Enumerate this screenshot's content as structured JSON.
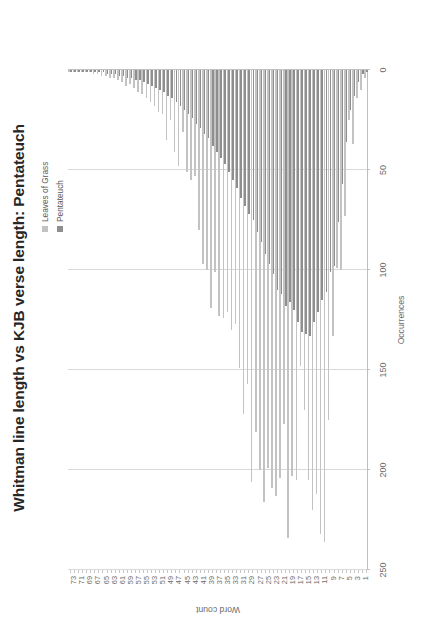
{
  "chart_data": {
    "type": "bar",
    "orientation": "horizontal",
    "title": "Whitman line length vs KJB verse length: Pentateuch",
    "xlabel": "Word count",
    "ylabel": "Occurrences",
    "ylim": [
      0,
      250
    ],
    "yticks": [
      250,
      200,
      150,
      100,
      50,
      0
    ],
    "grid": true,
    "legend_position": "top-right",
    "categories": [
      1,
      2,
      3,
      4,
      5,
      6,
      7,
      8,
      9,
      10,
      11,
      12,
      13,
      14,
      15,
      16,
      17,
      18,
      19,
      20,
      21,
      22,
      23,
      24,
      25,
      26,
      27,
      28,
      29,
      30,
      31,
      32,
      33,
      34,
      35,
      36,
      37,
      38,
      39,
      40,
      41,
      42,
      43,
      44,
      45,
      46,
      47,
      48,
      49,
      50,
      51,
      52,
      53,
      54,
      55,
      56,
      57,
      58,
      59,
      60,
      61,
      62,
      63,
      64,
      65,
      66,
      67,
      68,
      69,
      70,
      71,
      72,
      73,
      74
    ],
    "category_tick_labels": [
      "1",
      "3",
      "5",
      "7",
      "9",
      "11",
      "13",
      "15",
      "17",
      "19",
      "21",
      "23",
      "25",
      "27",
      "29",
      "31",
      "33",
      "35",
      "37",
      "39",
      "41",
      "43",
      "45",
      "47",
      "49",
      "51",
      "53",
      "55",
      "57",
      "59",
      "61",
      "63",
      "65",
      "67",
      "69",
      "71",
      "73"
    ],
    "series": [
      {
        "name": "Leaves of Grass",
        "color": "#c3c3c3",
        "values": [
          4,
          10,
          14,
          37,
          25,
          73,
          100,
          99,
          133,
          175,
          236,
          232,
          212,
          220,
          205,
          170,
          148,
          205,
          203,
          234,
          177,
          204,
          213,
          209,
          199,
          216,
          200,
          181,
          206,
          157,
          172,
          149,
          127,
          130,
          121,
          124,
          123,
          101,
          119,
          100,
          97,
          80,
          53,
          55,
          51,
          31,
          48,
          41,
          25,
          35,
          22,
          21,
          18,
          16,
          14,
          12,
          11,
          9,
          7,
          8,
          6,
          5,
          4,
          4,
          3,
          3,
          2,
          2,
          1,
          1,
          1,
          1,
          1,
          1
        ]
      },
      {
        "name": "Pentateuch",
        "color": "#8e8e8e",
        "values": [
          1,
          2,
          6,
          13,
          20,
          36,
          57,
          76,
          98,
          101,
          111,
          115,
          121,
          126,
          133,
          132,
          131,
          126,
          120,
          116,
          118,
          112,
          110,
          102,
          97,
          92,
          86,
          81,
          75,
          72,
          68,
          64,
          59,
          55,
          51,
          47,
          44,
          41,
          38,
          34,
          32,
          29,
          27,
          24,
          22,
          20,
          18,
          16,
          14,
          13,
          11,
          10,
          9,
          8,
          7,
          6,
          5,
          5,
          4,
          4,
          3,
          3,
          2,
          2,
          2,
          1,
          1,
          1,
          1,
          1,
          1,
          1,
          1,
          1
        ]
      }
    ]
  },
  "legend": {
    "items": [
      {
        "label": "Leaves of Grass",
        "color": "#c3c3c3"
      },
      {
        "label": "Pentateuch",
        "color": "#8e8e8e"
      }
    ]
  }
}
